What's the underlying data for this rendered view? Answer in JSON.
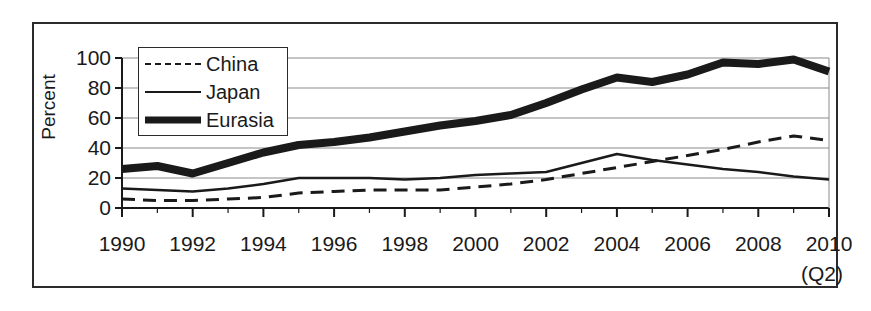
{
  "chart_data": {
    "type": "line",
    "title": "",
    "subtitle": "",
    "xlabel": "",
    "ylabel": "Percent",
    "xlim": [
      1990,
      2010
    ],
    "ylim": [
      0,
      100
    ],
    "grid": true,
    "grid_axis": "y",
    "legend_position": "upper-left-inside",
    "x_note": "(Q2)",
    "x": [
      1990,
      1991,
      1992,
      1993,
      1994,
      1995,
      1996,
      1997,
      1998,
      1999,
      2000,
      2001,
      2002,
      2003,
      2004,
      2005,
      2006,
      2007,
      2008,
      2009,
      2010
    ],
    "xtick_labels": [
      "1990",
      "1992",
      "1994",
      "1996",
      "1998",
      "2000",
      "2002",
      "2004",
      "2006",
      "2008",
      "2010"
    ],
    "xticks": [
      1990,
      1992,
      1994,
      1996,
      1998,
      2000,
      2002,
      2004,
      2006,
      2008,
      2010
    ],
    "ytick_labels": [
      "0",
      "20",
      "40",
      "60",
      "80",
      "100"
    ],
    "yticks": [
      0,
      20,
      40,
      60,
      80,
      100
    ],
    "series": [
      {
        "name": "China",
        "style": "dashed",
        "color": "#1a1a1a",
        "width": 3,
        "values": [
          6,
          5,
          5,
          6,
          7,
          10,
          11,
          12,
          12,
          12,
          14,
          16,
          19,
          23,
          27,
          31,
          35,
          39,
          44,
          48,
          45
        ]
      },
      {
        "name": "Japan",
        "style": "solid",
        "color": "#1a1a1a",
        "width": 2.5,
        "values": [
          13,
          12,
          11,
          13,
          16,
          20,
          20,
          20,
          19,
          20,
          22,
          23,
          24,
          30,
          36,
          32,
          29,
          26,
          24,
          21,
          19
        ]
      },
      {
        "name": "Eurasia",
        "style": "solid",
        "color": "#1a1a1a",
        "width": 8,
        "values": [
          26,
          28,
          23,
          30,
          37,
          42,
          44,
          47,
          51,
          55,
          58,
          62,
          70,
          79,
          87,
          84,
          89,
          97,
          96,
          99,
          91
        ]
      }
    ]
  },
  "legend": {
    "items": [
      {
        "label": "China",
        "swatch": "dashed-line-swatch"
      },
      {
        "label": "Japan",
        "swatch": "thin-line-swatch"
      },
      {
        "label": "Eurasia",
        "swatch": "thick-line-swatch"
      }
    ]
  },
  "axes": {
    "y_axis_title": "Percent",
    "x_axis_note": "(Q2)"
  },
  "colors": {
    "ink": "#1a1a1a",
    "frame": "#2b2b2b",
    "gridline": "#8a8a8a",
    "background": "#ffffff"
  }
}
